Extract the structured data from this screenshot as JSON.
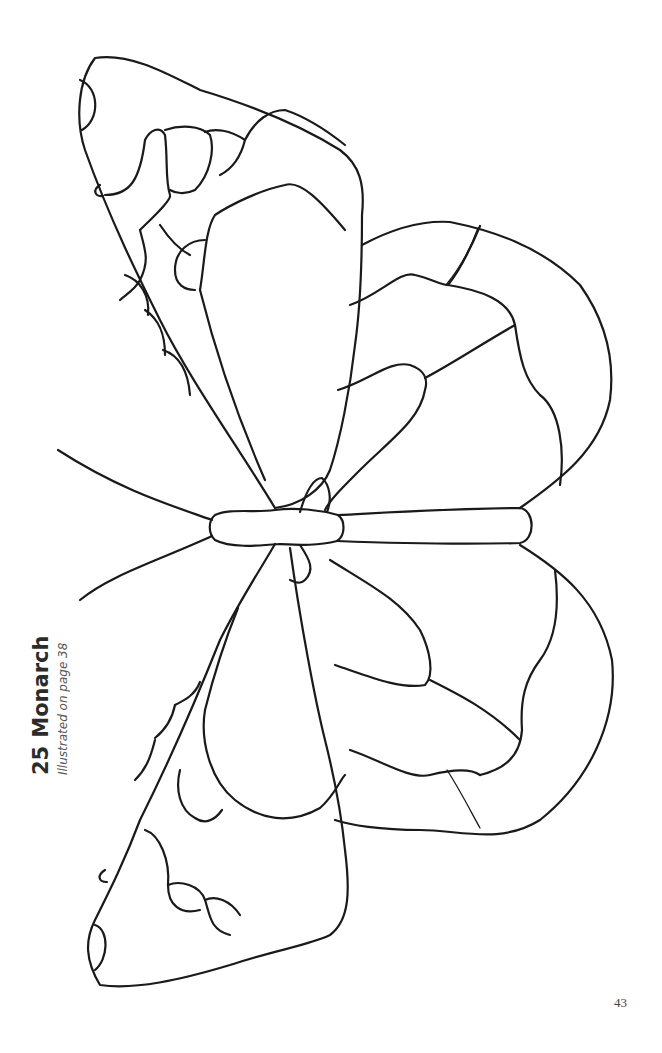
{
  "page": {
    "pattern_number": "25",
    "pattern_name": "Monarch",
    "subtitle": "Illustrated on page 38",
    "page_number": "43"
  },
  "illustration": {
    "subject": "monarch-butterfly-stained-glass-pattern",
    "style": "black line art on white",
    "line_color": "#1a1a1a",
    "background_color": "#ffffff"
  }
}
